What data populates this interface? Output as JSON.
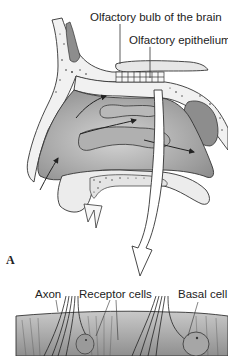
{
  "figure": {
    "labels": {
      "olfactory_bulb": "Olfactory bulb of the brain",
      "olfactory_epithelium": "Olfactory epithelium",
      "axon": "Axon",
      "receptor_cells": "Receptor cells",
      "basal_cell": "Basal cell"
    },
    "panel_label": "A",
    "colors": {
      "cavity_fill": "#a9a9a9",
      "bone_fill": "#f2f2f2",
      "line": "#333333",
      "tissue_fill": "#c8c8c8"
    }
  }
}
